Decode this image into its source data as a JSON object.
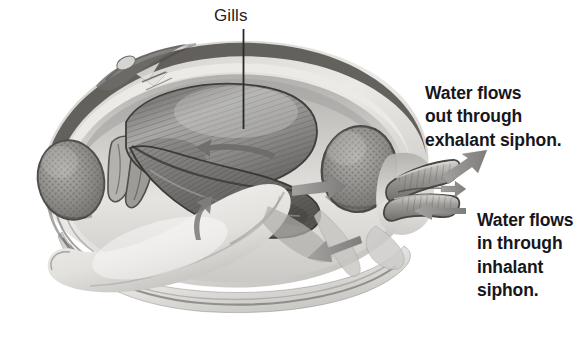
{
  "figure": {
    "background_color": "#ffffff",
    "style": "grayscale pencil illustration"
  },
  "labels": {
    "gills": "Gills",
    "gills_leader_line": "vertical-leader-line"
  },
  "callouts": [
    {
      "id": "exhalant",
      "text": "Water flows\nout through\nexhalant siphon.",
      "lines": [
        "Water flows",
        "out through",
        "exhalant siphon."
      ]
    },
    {
      "id": "inhalant",
      "text": "Water flows\nin through\ninhalant\nsiphon.",
      "lines": [
        "Water flows",
        "in through",
        "inhalant",
        "siphon."
      ]
    }
  ],
  "anatomy": {
    "parts": [
      "shell",
      "mantle",
      "gills",
      "foot",
      "anterior-adductor-muscle",
      "posterior-adductor-muscle",
      "exhalant-siphon",
      "inhalant-siphon",
      "labial-palps",
      "hinge"
    ]
  },
  "flow_arrows": [
    {
      "id": "exhalant-out",
      "direction": "up-right",
      "meaning": "water out of exhalant siphon"
    },
    {
      "id": "inhalant-in",
      "direction": "left",
      "meaning": "water into inhalant siphon"
    },
    {
      "id": "mantle-cavity-right",
      "direction": "right",
      "meaning": "water toward exhalant siphon"
    },
    {
      "id": "mantle-cavity-left",
      "direction": "left",
      "meaning": "water entering mantle cavity"
    },
    {
      "id": "gill-up",
      "direction": "up",
      "meaning": "water drawn up through gills"
    },
    {
      "id": "gill-curve",
      "direction": "up-left",
      "meaning": "water across gill surface"
    }
  ],
  "colors": {
    "text": "#17161a",
    "label_text": "#1e1d21",
    "background": "#ffffff",
    "shell_light": "#f2f1ef",
    "shell_mid": "#b9b7b4",
    "shell_dark": "#5c5a58",
    "gill_mid": "#8e8d8b",
    "gill_dark": "#5d5c5b",
    "muscle": "#8a8987",
    "arrow": "#8b8a89",
    "outline": "#3a3937"
  }
}
